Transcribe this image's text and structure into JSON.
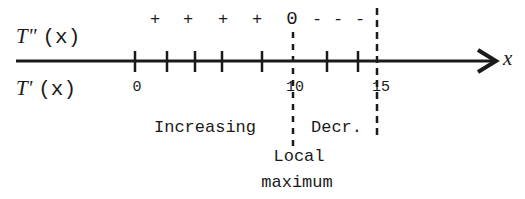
{
  "diagram": {
    "type": "sign-chart",
    "axis_label": "x",
    "rows": {
      "second_derivative": {
        "name": "T\"",
        "arg": "(x)"
      },
      "first_derivative": {
        "name": "T'",
        "arg": "(x)"
      }
    },
    "second_derivative_signs": [
      "+",
      "+",
      "+",
      "+",
      "0",
      "-",
      "-",
      "-"
    ],
    "tick_labels": [
      "0",
      "10",
      "15"
    ],
    "intervals": {
      "left": "Increasing",
      "right": "Decr."
    },
    "annotation": {
      "line1": "Local",
      "line2": "maximum"
    },
    "colors": {
      "ink": "#1a1a1a",
      "background": "#ffffff"
    }
  }
}
